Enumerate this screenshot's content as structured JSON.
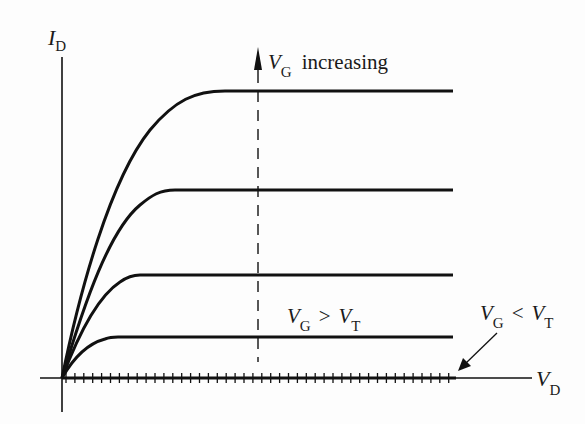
{
  "figure": {
    "y_axis_label": {
      "main": "I",
      "sub": "D"
    },
    "x_axis_label": {
      "main": "V",
      "sub": "D"
    },
    "annotations": {
      "increasing": {
        "main": "V",
        "sub": "G",
        "text": "increasing"
      },
      "above_threshold": {
        "main1": "V",
        "sub1": "G",
        "op": ">",
        "main2": "V",
        "sub2": "T"
      },
      "below_threshold": {
        "main1": "V",
        "sub1": "G",
        "op": "<",
        "main2": "V",
        "sub2": "T"
      }
    }
  },
  "chart_data": {
    "type": "line",
    "xlabel": "V_D",
    "ylabel": "I_D",
    "grid": false,
    "axis_ticks_numeric": false,
    "series": [
      {
        "name": "V_G > V_T (highest V_G)",
        "saturation_level": 0.9,
        "knee_x": 0.39
      },
      {
        "name": "V_G > V_T (3rd)",
        "saturation_level": 0.59,
        "knee_x": 0.26
      },
      {
        "name": "V_G > V_T (2nd)",
        "saturation_level": 0.32,
        "knee_x": 0.17
      },
      {
        "name": "V_G > V_T (lowest)",
        "saturation_level": 0.13,
        "knee_x": 0.12
      },
      {
        "name": "V_G < V_T",
        "saturation_level": 0.0,
        "style": "hatched along V_D axis"
      }
    ],
    "annotations": [
      "V_G increasing (arrow upward along dashed line)",
      "V_G > V_T",
      "V_G < V_T (arrow pointing to hatched axis)"
    ]
  }
}
